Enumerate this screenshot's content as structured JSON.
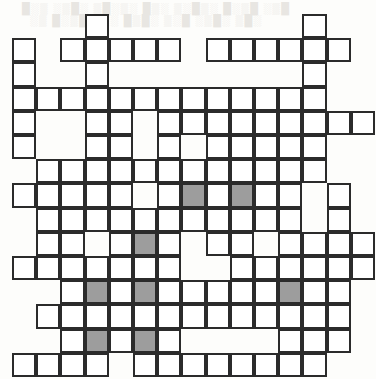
{
  "page": {
    "width": 376,
    "height": 379,
    "background_color": "#ffffff"
  },
  "grid": {
    "origin_x": 12,
    "origin_y": 14,
    "cell_size": 24.2,
    "columns": 15,
    "rows": 15,
    "line_color": "#2b2b2b",
    "line_width": 2,
    "cell_color": "#ffffff",
    "shaded_color": "#9d9d9d",
    "legend": {
      "0": "empty / no cell",
      "1": "open white cell",
      "2": "shaded grey cell"
    },
    "matrix": [
      [
        0,
        0,
        0,
        1,
        0,
        0,
        0,
        0,
        0,
        0,
        0,
        0,
        1,
        0,
        0
      ],
      [
        1,
        0,
        1,
        1,
        1,
        1,
        1,
        0,
        1,
        1,
        1,
        1,
        1,
        1,
        0
      ],
      [
        1,
        0,
        0,
        1,
        0,
        0,
        0,
        0,
        0,
        0,
        0,
        0,
        1,
        0,
        0
      ],
      [
        1,
        1,
        1,
        1,
        1,
        1,
        1,
        1,
        1,
        1,
        1,
        1,
        1,
        0,
        0
      ],
      [
        1,
        0,
        0,
        1,
        1,
        0,
        1,
        1,
        1,
        1,
        1,
        1,
        1,
        1,
        1
      ],
      [
        1,
        0,
        0,
        1,
        1,
        0,
        1,
        0,
        1,
        1,
        1,
        1,
        1,
        0,
        0
      ],
      [
        0,
        1,
        1,
        1,
        1,
        1,
        1,
        1,
        1,
        1,
        1,
        1,
        1,
        0,
        0
      ],
      [
        1,
        1,
        1,
        1,
        1,
        0,
        1,
        2,
        1,
        2,
        1,
        1,
        0,
        1,
        0
      ],
      [
        0,
        1,
        1,
        1,
        1,
        1,
        1,
        1,
        1,
        1,
        1,
        1,
        0,
        1,
        0
      ],
      [
        0,
        1,
        1,
        0,
        1,
        2,
        1,
        0,
        1,
        1,
        0,
        1,
        1,
        1,
        1
      ],
      [
        1,
        1,
        1,
        1,
        1,
        1,
        1,
        0,
        0,
        1,
        1,
        1,
        1,
        1,
        1
      ],
      [
        0,
        0,
        1,
        2,
        1,
        2,
        1,
        1,
        1,
        1,
        1,
        2,
        1,
        1,
        0
      ],
      [
        0,
        1,
        1,
        1,
        1,
        1,
        1,
        1,
        1,
        1,
        1,
        1,
        1,
        1,
        0
      ],
      [
        0,
        0,
        1,
        2,
        1,
        2,
        1,
        0,
        0,
        0,
        0,
        1,
        1,
        1,
        0
      ],
      [
        1,
        1,
        1,
        1,
        0,
        1,
        1,
        1,
        1,
        1,
        1,
        1,
        1,
        0,
        0
      ]
    ]
  },
  "scan_artifacts": {
    "ghost_text_lines": [
      {
        "text": "█░▒ ░▒█░ ▒█░▒░ █▒░ ▒░█▒░ █░▒█ ░▒█",
        "x": 22,
        "y": 2
      },
      {
        "text": "░▒ █░▒█ ░▒░ █▒█░ ▒░█ ░▒█░ ▒█░",
        "x": 30,
        "y": 14
      }
    ]
  }
}
